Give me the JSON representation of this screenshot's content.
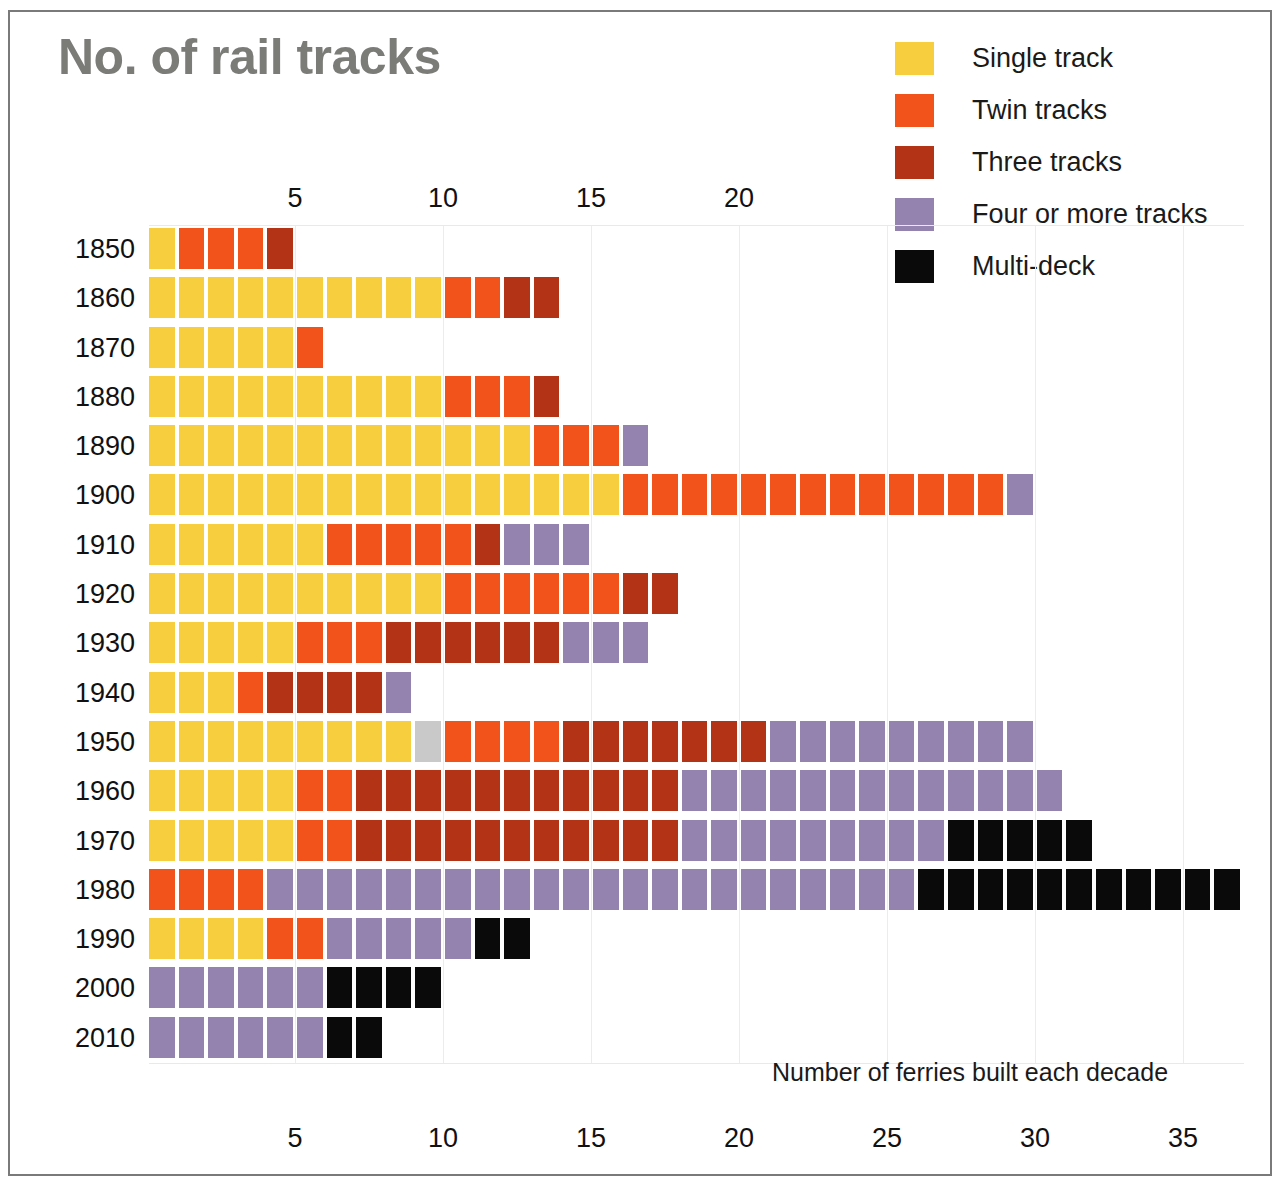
{
  "title": "No. of rail tracks",
  "footnote": "Number of ferries built each decade",
  "colors": {
    "single": "#F6CE3E",
    "twin": "#F1531A",
    "three": "#B23316",
    "four_plus": "#9383AE",
    "multideck": "#0A0A0A",
    "unknown": "#C9C9C9",
    "title_grey": "#7B7B78",
    "grid": "#EEECEA",
    "frame": "#7A7A7A"
  },
  "legend": {
    "items": [
      {
        "key": "single",
        "label": "Single track",
        "color": "#F6CE3E"
      },
      {
        "key": "twin",
        "label": "Twin tracks",
        "color": "#F1531A"
      },
      {
        "key": "three",
        "label": "Three tracks",
        "color": "#B23316"
      },
      {
        "key": "four_plus",
        "label": "Four or more tracks",
        "color": "#9383AE"
      },
      {
        "key": "multideck",
        "label": "Multi-deck",
        "color": "#0A0A0A"
      }
    ]
  },
  "axis": {
    "top_ticks": [
      5,
      10,
      15,
      20
    ],
    "bottom_ticks": [
      5,
      10,
      15,
      20,
      25,
      30,
      35
    ],
    "unit_label": "",
    "max": 37
  },
  "chart_data": {
    "type": "bar",
    "subtype": "stacked-waffle-isotype",
    "title": "No. of rail tracks",
    "xlabel": "Number of ferries built each decade",
    "ylabel": "Decade",
    "xlim": [
      0,
      37
    ],
    "grid": true,
    "legend_position": "top-right",
    "categories": [
      "1850",
      "1860",
      "1870",
      "1880",
      "1890",
      "1900",
      "1910",
      "1920",
      "1930",
      "1940",
      "1950",
      "1960",
      "1970",
      "1980",
      "1990",
      "2000",
      "2010"
    ],
    "series": [
      {
        "name": "Single track",
        "key": "single",
        "color": "#F6CE3E",
        "values": [
          1,
          10,
          5,
          10,
          13,
          16,
          6,
          10,
          5,
          3,
          9,
          5,
          5,
          0,
          4,
          0,
          0
        ]
      },
      {
        "name": "Twin tracks",
        "key": "twin",
        "color": "#F1531A",
        "values": [
          3,
          2,
          1,
          3,
          3,
          13,
          5,
          6,
          3,
          1,
          4,
          2,
          2,
          4,
          2,
          0,
          0
        ]
      },
      {
        "name": "Three tracks",
        "key": "three",
        "color": "#B23316",
        "values": [
          1,
          2,
          0,
          1,
          0,
          0,
          1,
          2,
          6,
          4,
          7,
          11,
          11,
          0,
          0,
          0,
          0
        ]
      },
      {
        "name": "Four or more tracks",
        "key": "four_plus",
        "color": "#9383AE",
        "values": [
          0,
          0,
          0,
          0,
          1,
          1,
          3,
          0,
          3,
          1,
          9,
          13,
          9,
          22,
          5,
          6,
          6
        ]
      },
      {
        "name": "Multi-deck",
        "key": "multideck",
        "color": "#0A0A0A",
        "values": [
          0,
          0,
          0,
          0,
          0,
          0,
          0,
          0,
          0,
          0,
          0,
          0,
          5,
          11,
          2,
          4,
          2
        ]
      },
      {
        "name": "Unknown",
        "key": "unknown",
        "color": "#C9C9C9",
        "values": [
          0,
          0,
          0,
          0,
          0,
          0,
          0,
          0,
          0,
          0,
          1,
          0,
          0,
          0,
          0,
          0,
          0
        ]
      }
    ],
    "totals": [
      5,
      14,
      6,
      14,
      17,
      30,
      15,
      18,
      17,
      9,
      30,
      31,
      32,
      37,
      13,
      10,
      8
    ]
  },
  "rows": [
    {
      "decade": "1850",
      "segments": [
        {
          "key": "single",
          "n": 1
        },
        {
          "key": "twin",
          "n": 3
        },
        {
          "key": "three",
          "n": 1
        }
      ]
    },
    {
      "decade": "1860",
      "segments": [
        {
          "key": "single",
          "n": 10
        },
        {
          "key": "twin",
          "n": 2
        },
        {
          "key": "three",
          "n": 2
        }
      ]
    },
    {
      "decade": "1870",
      "segments": [
        {
          "key": "single",
          "n": 5
        },
        {
          "key": "twin",
          "n": 1
        }
      ]
    },
    {
      "decade": "1880",
      "segments": [
        {
          "key": "single",
          "n": 10
        },
        {
          "key": "twin",
          "n": 3
        },
        {
          "key": "three",
          "n": 1
        }
      ]
    },
    {
      "decade": "1890",
      "segments": [
        {
          "key": "single",
          "n": 13
        },
        {
          "key": "twin",
          "n": 3
        },
        {
          "key": "four_plus",
          "n": 1
        }
      ]
    },
    {
      "decade": "1900",
      "segments": [
        {
          "key": "single",
          "n": 16
        },
        {
          "key": "twin",
          "n": 13
        },
        {
          "key": "four_plus",
          "n": 1
        }
      ]
    },
    {
      "decade": "1910",
      "segments": [
        {
          "key": "single",
          "n": 6
        },
        {
          "key": "twin",
          "n": 5
        },
        {
          "key": "three",
          "n": 1
        },
        {
          "key": "four_plus",
          "n": 3
        }
      ]
    },
    {
      "decade": "1920",
      "segments": [
        {
          "key": "single",
          "n": 10
        },
        {
          "key": "twin",
          "n": 6
        },
        {
          "key": "three",
          "n": 2
        }
      ]
    },
    {
      "decade": "1930",
      "segments": [
        {
          "key": "single",
          "n": 5
        },
        {
          "key": "twin",
          "n": 3
        },
        {
          "key": "three",
          "n": 6
        },
        {
          "key": "four_plus",
          "n": 3
        }
      ]
    },
    {
      "decade": "1940",
      "segments": [
        {
          "key": "single",
          "n": 3
        },
        {
          "key": "twin",
          "n": 1
        },
        {
          "key": "three",
          "n": 4
        },
        {
          "key": "four_plus",
          "n": 1
        }
      ]
    },
    {
      "decade": "1950",
      "segments": [
        {
          "key": "single",
          "n": 9
        },
        {
          "key": "unknown",
          "n": 1
        },
        {
          "key": "twin",
          "n": 4
        },
        {
          "key": "three",
          "n": 7
        },
        {
          "key": "four_plus",
          "n": 9
        }
      ]
    },
    {
      "decade": "1960",
      "segments": [
        {
          "key": "single",
          "n": 5
        },
        {
          "key": "twin",
          "n": 2
        },
        {
          "key": "three",
          "n": 11
        },
        {
          "key": "four_plus",
          "n": 13
        }
      ]
    },
    {
      "decade": "1970",
      "segments": [
        {
          "key": "single",
          "n": 5
        },
        {
          "key": "twin",
          "n": 2
        },
        {
          "key": "three",
          "n": 11
        },
        {
          "key": "four_plus",
          "n": 9
        },
        {
          "key": "multideck",
          "n": 5
        }
      ]
    },
    {
      "decade": "1980",
      "segments": [
        {
          "key": "twin",
          "n": 4
        },
        {
          "key": "four_plus",
          "n": 22
        },
        {
          "key": "multideck",
          "n": 11
        }
      ]
    },
    {
      "decade": "1990",
      "segments": [
        {
          "key": "single",
          "n": 4
        },
        {
          "key": "twin",
          "n": 2
        },
        {
          "key": "four_plus",
          "n": 5
        },
        {
          "key": "multideck",
          "n": 2
        }
      ]
    },
    {
      "decade": "2000",
      "segments": [
        {
          "key": "four_plus",
          "n": 6
        },
        {
          "key": "multideck",
          "n": 4
        }
      ]
    },
    {
      "decade": "2010",
      "segments": [
        {
          "key": "four_plus",
          "n": 6
        },
        {
          "key": "multideck",
          "n": 2
        }
      ]
    }
  ]
}
